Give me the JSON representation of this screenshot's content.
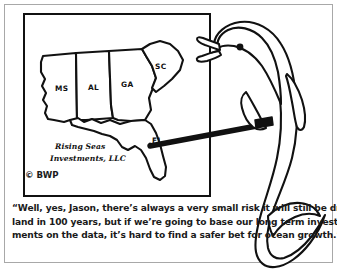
{
  "panel": {
    "kind": "single-panel-cartoon",
    "background_color": "#ffffff",
    "border_color": "#a8a8a8",
    "ink_color": "#111111"
  },
  "map": {
    "title_on_map": "Rising Seas Investments, LLC",
    "firm_name_line1": "Rising Seas",
    "firm_name_line2": "Investments, LLC",
    "copyright": "© BWP",
    "state_labels": [
      {
        "id": "ms",
        "label": "MS"
      },
      {
        "id": "al",
        "label": "AL"
      },
      {
        "id": "ga",
        "label": "GA"
      },
      {
        "id": "sc",
        "label": "SC"
      },
      {
        "id": "fl",
        "label": "FL"
      }
    ]
  },
  "character": {
    "name": "dolphin-presenter",
    "holding": "pointer-stick",
    "pointing_at": "FL"
  },
  "caption": {
    "full_text": "“Well, yes, Jason, there’s always a very small risk it will still be dry land in 100 years, but if we’re going to base our long term investments on the data, it’s hard to find a safer bet for ocean growth.”",
    "lines": [
      "“Well, yes, Jason, there’s always a very small risk it will still be dry",
      "land in 100 years, but if we’re going to base our long term invest-",
      "ments on the data, it’s hard to find a safer bet for ocean growth.”"
    ]
  }
}
